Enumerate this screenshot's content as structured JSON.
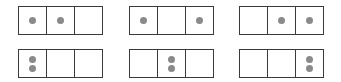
{
  "diagram": {
    "colors": {
      "border": "#3a3a3a",
      "dot": "#8a8a8a",
      "background": "#ffffff"
    },
    "strips": [
      {
        "row": 0,
        "col": 0,
        "cells": [
          1,
          1,
          0
        ],
        "layout": "horizontal"
      },
      {
        "row": 0,
        "col": 1,
        "cells": [
          1,
          0,
          1
        ],
        "layout": "horizontal"
      },
      {
        "row": 0,
        "col": 2,
        "cells": [
          0,
          1,
          1
        ],
        "layout": "horizontal"
      },
      {
        "row": 1,
        "col": 0,
        "cells": [
          2,
          0,
          0
        ],
        "layout": "stacked"
      },
      {
        "row": 1,
        "col": 1,
        "cells": [
          0,
          2,
          0
        ],
        "layout": "stacked"
      },
      {
        "row": 1,
        "col": 2,
        "cells": [
          0,
          0,
          2
        ],
        "layout": "stacked"
      }
    ]
  }
}
